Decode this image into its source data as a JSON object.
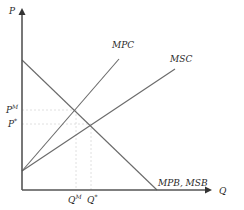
{
  "diagram": {
    "axes": {
      "y_label": "P",
      "x_label": "Q"
    },
    "curves": [
      {
        "id": "mpc",
        "label": "MPC",
        "kind": "supply-private"
      },
      {
        "id": "msc",
        "label": "MSC",
        "kind": "supply-social"
      },
      {
        "id": "demand",
        "label": "MPB, MSB",
        "kind": "demand"
      }
    ],
    "price_labels": {
      "market": {
        "base": "P",
        "sup": "M"
      },
      "optimal": {
        "base": "P",
        "sup": "*"
      }
    },
    "quantity_labels": {
      "market": {
        "base": "Q",
        "sup": "M"
      },
      "optimal": {
        "base": "Q",
        "sup": "*"
      }
    },
    "colors": {
      "axis": "#555555",
      "curve": "#6a6a6a",
      "guide": "#d8d8d8",
      "text": "#2a2a2a"
    }
  }
}
